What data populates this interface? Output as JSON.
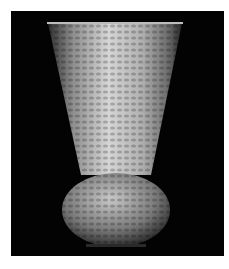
{
  "image": {
    "subject": "hammered metal vase on black background",
    "alt": "Hammered silver flared vase with bulbous base",
    "colors": {
      "background": "#030303",
      "frame": "#ffffff",
      "metal_light": "#d8d8d8",
      "metal_mid": "#9a9a9a",
      "metal_dark": "#3a3a3a"
    }
  }
}
